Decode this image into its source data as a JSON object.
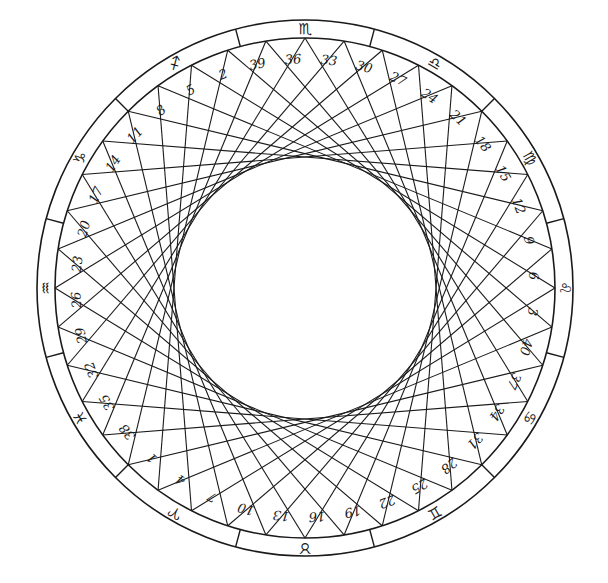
{
  "diagram": {
    "point_count": 40,
    "chord_step": 13,
    "label_sequence_clockwise_from_top": [
      36,
      33,
      30,
      27,
      24,
      21,
      18,
      15,
      12,
      9,
      6,
      3,
      40,
      37,
      34,
      31,
      28,
      25,
      22,
      19,
      16,
      13,
      10,
      7,
      4,
      1,
      38,
      35,
      32,
      29,
      26,
      23,
      20,
      17,
      14,
      11,
      8,
      5,
      2,
      39
    ],
    "zodiac_signs_clockwise_from_top": [
      {
        "name": "scorpio",
        "glyph": "♏"
      },
      {
        "name": "libra",
        "glyph": "♎"
      },
      {
        "name": "virgo",
        "glyph": "♍"
      },
      {
        "name": "leo",
        "glyph": "♌"
      },
      {
        "name": "cancer",
        "glyph": "♋"
      },
      {
        "name": "gemini",
        "glyph": "♊"
      },
      {
        "name": "taurus",
        "glyph": "♉"
      },
      {
        "name": "aries",
        "glyph": "♈"
      },
      {
        "name": "pisces",
        "glyph": "♓"
      },
      {
        "name": "aquarius",
        "glyph": "♒"
      },
      {
        "name": "capricorn",
        "glyph": "♑"
      },
      {
        "name": "sagittarius",
        "glyph": "♐"
      }
    ],
    "colors": {
      "ink": "#1a1a1a",
      "paper": "#ffffff"
    }
  }
}
